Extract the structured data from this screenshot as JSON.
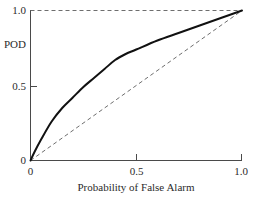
{
  "chart_data": {
    "type": "line",
    "title": "",
    "xlabel": "Probability of False Alarm",
    "ylabel": "POD",
    "xlim": [
      0,
      1.0
    ],
    "ylim": [
      0,
      1.0
    ],
    "grid": false,
    "legend": "none",
    "xticks": [
      {
        "value": 0,
        "label": "0"
      },
      {
        "value": 0.5,
        "label": "0.5"
      },
      {
        "value": 1.0,
        "label": "1.0"
      }
    ],
    "yticks": [
      {
        "value": 0,
        "label": "0"
      },
      {
        "value": 0.5,
        "label": "0.5"
      },
      {
        "value": 1.0,
        "label": "1.0"
      }
    ],
    "series": [
      {
        "name": "ROC curve",
        "style": "solid",
        "color": "#111111",
        "x": [
          0.0,
          0.02,
          0.05,
          0.1,
          0.15,
          0.2,
          0.25,
          0.3,
          0.35,
          0.4,
          0.45,
          0.5,
          0.6,
          0.7,
          0.8,
          0.9,
          1.0
        ],
        "y": [
          0.0,
          0.06,
          0.14,
          0.26,
          0.35,
          0.42,
          0.49,
          0.55,
          0.61,
          0.67,
          0.71,
          0.74,
          0.8,
          0.85,
          0.9,
          0.95,
          1.0
        ]
      },
      {
        "name": "No-skill reference line",
        "style": "dashed",
        "color": "#6e6e6e",
        "x": [
          0.0,
          1.0
        ],
        "y": [
          0.0,
          1.0
        ]
      },
      {
        "name": "Perfect POD reference line",
        "style": "dashed",
        "color": "#6e6e6e",
        "x": [
          0.0,
          1.0
        ],
        "y": [
          1.0,
          1.0
        ]
      }
    ]
  },
  "labels": {
    "y_axis_title": "POD",
    "x_axis_title": "Probability of False Alarm",
    "x_tick_0": "0",
    "x_tick_mid": "0.5",
    "x_tick_max": "1.0",
    "y_tick_0": "0",
    "y_tick_mid": "0.5",
    "y_tick_max": "1.0"
  }
}
